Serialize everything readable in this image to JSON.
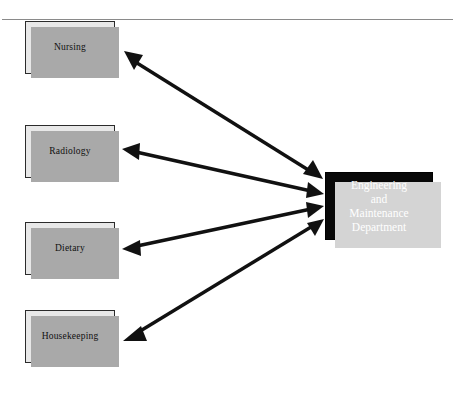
{
  "diagram": {
    "background_color": "#ffffff",
    "top_rule": {
      "color": "#8a8a8a",
      "y": 19
    },
    "departments": [
      {
        "id": "nursing",
        "label": "Nursing",
        "x": 25,
        "y": 21,
        "width": 90,
        "height": 53,
        "fill": "#e8e8e8",
        "border": "#2b2b2b",
        "shadow": "#a9a9a9"
      },
      {
        "id": "radiology",
        "label": "Radiology",
        "x": 25,
        "y": 125,
        "width": 90,
        "height": 53,
        "fill": "#e8e8e8",
        "border": "#2b2b2b",
        "shadow": "#a9a9a9"
      },
      {
        "id": "dietary",
        "label": "Dietary",
        "x": 25,
        "y": 222,
        "width": 90,
        "height": 53,
        "fill": "#e8e8e8",
        "border": "#2b2b2b",
        "shadow": "#a9a9a9"
      },
      {
        "id": "housekeeping",
        "label": "Housekeeping",
        "x": 25,
        "y": 310,
        "width": 90,
        "height": 53,
        "fill": "#e8e8e8",
        "border": "#2b2b2b",
        "shadow": "#a9a9a9"
      }
    ],
    "central": {
      "id": "engineering-maintenance",
      "lines": [
        "Engineering",
        "and",
        "Maintenance",
        "Department"
      ],
      "x": 325,
      "y": 172,
      "width": 108,
      "height": 68,
      "fill": "#080808",
      "text_color": "#ffffff",
      "shadow": "#d4d4d4"
    },
    "connections": [
      {
        "id": "nursing-engineering",
        "from": "nursing",
        "to": "engineering-maintenance",
        "arrowheads": "both",
        "color": "#111111",
        "x1": 127,
        "y1": 57,
        "x2": 317,
        "y2": 176
      },
      {
        "id": "radiology-engineering",
        "from": "radiology",
        "to": "engineering-maintenance",
        "arrowheads": "both",
        "color": "#111111",
        "x1": 127,
        "y1": 149,
        "x2": 317,
        "y2": 192
      },
      {
        "id": "dietary-engineering",
        "from": "dietary",
        "to": "engineering-maintenance",
        "arrowheads": "both",
        "color": "#111111",
        "x1": 127,
        "y1": 249,
        "x2": 317,
        "y2": 208
      },
      {
        "id": "housekeeping-engineering",
        "from": "housekeeping",
        "to": "engineering-maintenance",
        "arrowheads": "both",
        "color": "#111111",
        "x1": 127,
        "y1": 338,
        "x2": 317,
        "y2": 224
      }
    ]
  }
}
